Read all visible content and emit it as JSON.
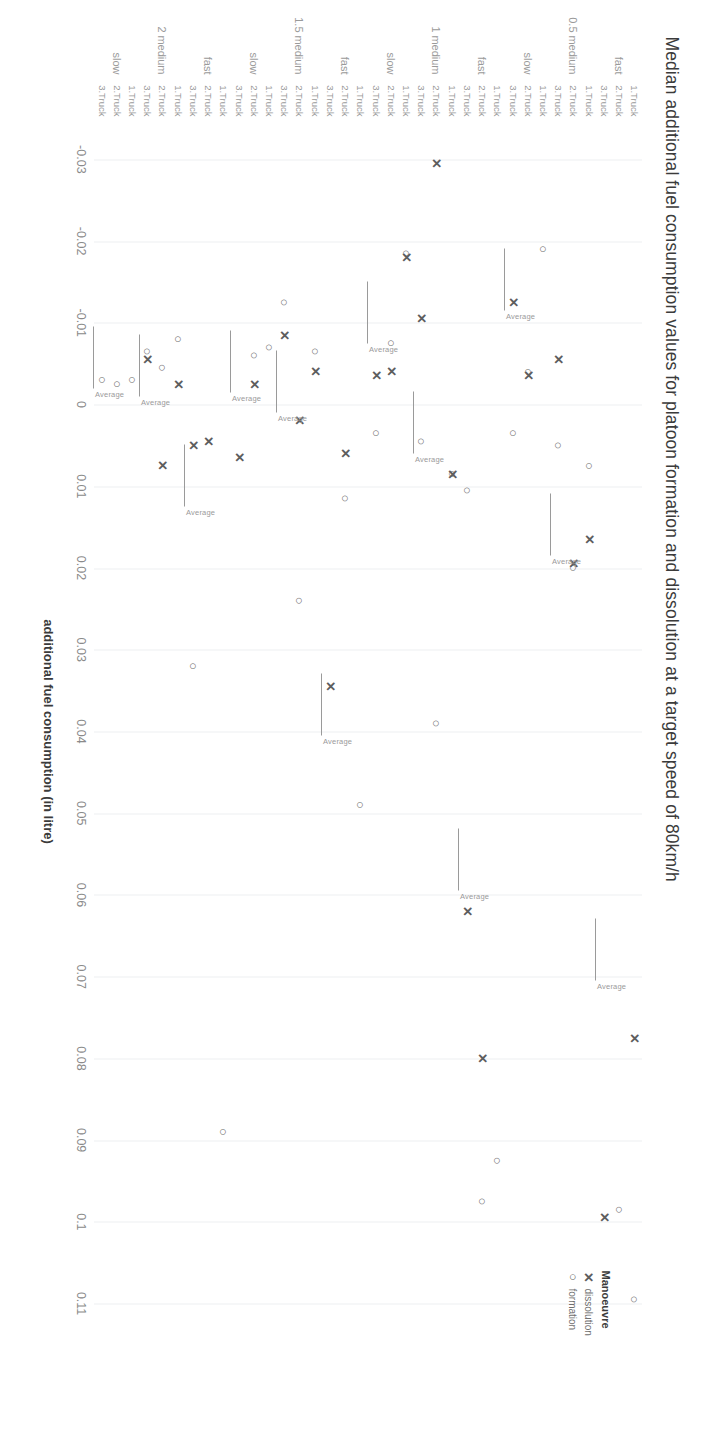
{
  "chart_data": {
    "type": "scatter",
    "title": "Median additional fuel consumption values for platoon formation and dissolution at a target speed of 80km/h",
    "xlabel": "additional fuel consumption (in litre)",
    "ylabel": "",
    "xlim": [
      -0.035,
      0.115
    ],
    "xticks": [
      -0.03,
      -0.02,
      -0.01,
      0,
      0.01,
      0.02,
      0.03,
      0.04,
      0.05,
      0.06,
      0.07,
      0.08,
      0.09,
      0.1,
      0.11
    ],
    "xticklabels": [
      "-0.03",
      "-0.02",
      "-0.01",
      "0",
      "0.01",
      "0.02",
      "0.03",
      "0.04",
      "0.05",
      "0.06",
      "0.07",
      "0.08",
      "0.09",
      "0.1",
      "0.11"
    ],
    "grid": true,
    "legend": {
      "title": "Manoeuvre",
      "position": "right",
      "entries": [
        {
          "label": "dissolution",
          "marker": "x",
          "glyph": "✕"
        },
        {
          "label": "formation",
          "marker": "o",
          "glyph": "○"
        }
      ]
    },
    "category_labels": {
      "distances": [
        "0.5",
        "1",
        "1.5",
        "2"
      ],
      "speeds": [
        "fast",
        "medium",
        "slow"
      ],
      "trucks": [
        "1.Truck",
        "2.Truck",
        "3.Truck"
      ]
    },
    "average_label": "Average",
    "groups": [
      {
        "distance": "0.5",
        "speeds": [
          {
            "speed": "fast",
            "average": 0.0705,
            "rows": [
              {
                "truck": "1.Truck",
                "formation": 0.1095,
                "dissolution": 0.0775
              },
              {
                "truck": "2.Truck",
                "formation": 0.0985,
                "dissolution": null
              },
              {
                "truck": "3.Truck",
                "formation": null,
                "dissolution": 0.0995
              }
            ]
          },
          {
            "speed": "medium",
            "average": 0.0185,
            "rows": [
              {
                "truck": "1.Truck",
                "formation": 0.0075,
                "dissolution": 0.0165
              },
              {
                "truck": "2.Truck",
                "formation": 0.02,
                "dissolution": 0.0195
              },
              {
                "truck": "3.Truck",
                "formation": 0.005,
                "dissolution": -0.0055
              }
            ]
          },
          {
            "speed": "slow",
            "average": -0.0115,
            "rows": [
              {
                "truck": "1.Truck",
                "formation": -0.019,
                "dissolution": null
              },
              {
                "truck": "2.Truck",
                "formation": -0.004,
                "dissolution": -0.0035
              },
              {
                "truck": "3.Truck",
                "formation": 0.0035,
                "dissolution": -0.0125
              }
            ]
          }
        ]
      },
      {
        "distance": "1",
        "speeds": [
          {
            "speed": "fast",
            "average": 0.0595,
            "rows": [
              {
                "truck": "1.Truck",
                "formation": 0.0925,
                "dissolution": null
              },
              {
                "truck": "2.Truck",
                "formation": 0.0975,
                "dissolution": 0.08
              },
              {
                "truck": "3.Truck",
                "formation": 0.0105,
                "dissolution": 0.062
              }
            ]
          },
          {
            "speed": "medium",
            "average": 0.006,
            "rows": [
              {
                "truck": "1.Truck",
                "formation": 0.0085,
                "dissolution": 0.0085
              },
              {
                "truck": "2.Truck",
                "formation": 0.039,
                "dissolution": -0.0295
              },
              {
                "truck": "3.Truck",
                "formation": 0.0045,
                "dissolution": -0.0105
              }
            ]
          },
          {
            "speed": "slow",
            "average": -0.0075,
            "rows": [
              {
                "truck": "1.Truck",
                "formation": -0.0185,
                "dissolution": -0.018
              },
              {
                "truck": "2.Truck",
                "formation": -0.0075,
                "dissolution": -0.004
              },
              {
                "truck": "3.Truck",
                "formation": 0.0035,
                "dissolution": -0.0035
              }
            ]
          }
        ]
      },
      {
        "distance": "1.5",
        "speeds": [
          {
            "speed": "fast",
            "average": 0.0405,
            "rows": [
              {
                "truck": "1.Truck",
                "formation": 0.049,
                "dissolution": null
              },
              {
                "truck": "2.Truck",
                "formation": 0.0115,
                "dissolution": 0.006
              },
              {
                "truck": "3.Truck",
                "formation": null,
                "dissolution": 0.0345
              }
            ]
          },
          {
            "speed": "medium",
            "average": 0.001,
            "rows": [
              {
                "truck": "1.Truck",
                "formation": -0.0065,
                "dissolution": -0.004
              },
              {
                "truck": "2.Truck",
                "formation": 0.024,
                "dissolution": 0.002
              },
              {
                "truck": "3.Truck",
                "formation": -0.0125,
                "dissolution": -0.0085
              }
            ]
          },
          {
            "speed": "slow",
            "average": -0.0015,
            "rows": [
              {
                "truck": "1.Truck",
                "formation": -0.007,
                "dissolution": null
              },
              {
                "truck": "2.Truck",
                "formation": -0.006,
                "dissolution": -0.0025
              },
              {
                "truck": "3.Truck",
                "formation": null,
                "dissolution": 0.0065
              }
            ]
          }
        ]
      },
      {
        "distance": "2",
        "speeds": [
          {
            "speed": "fast",
            "average": 0.0125,
            "rows": [
              {
                "truck": "1.Truck",
                "formation": 0.089,
                "dissolution": null
              },
              {
                "truck": "2.Truck",
                "formation": null,
                "dissolution": 0.0045
              },
              {
                "truck": "3.Truck",
                "formation": 0.032,
                "dissolution": 0.005
              }
            ]
          },
          {
            "speed": "medium",
            "average": -0.001,
            "rows": [
              {
                "truck": "1.Truck",
                "formation": -0.008,
                "dissolution": -0.0025
              },
              {
                "truck": "2.Truck",
                "formation": -0.0045,
                "dissolution": 0.0075
              },
              {
                "truck": "3.Truck",
                "formation": -0.0065,
                "dissolution": -0.0055
              }
            ]
          },
          {
            "speed": "slow",
            "average": -0.002,
            "rows": [
              {
                "truck": "1.Truck",
                "formation": -0.003,
                "dissolution": null
              },
              {
                "truck": "2.Truck",
                "formation": -0.0025,
                "dissolution": null
              },
              {
                "truck": "3.Truck",
                "formation": -0.003,
                "dissolution": null
              }
            ]
          }
        ]
      }
    ]
  },
  "colors": {
    "text": "#3b3b3b",
    "tick": "#8a8a8a",
    "category": "#9a9a9a",
    "marker": "#6f6f6f",
    "marker_bold": "#5e5e5e",
    "grid": "#eef0f2",
    "average_line": "#9a9a9a"
  }
}
